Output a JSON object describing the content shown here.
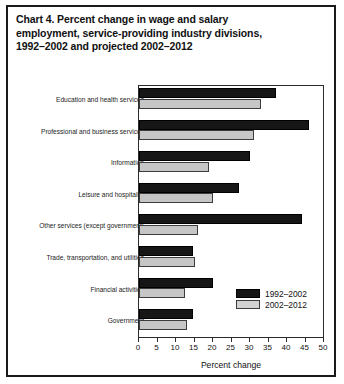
{
  "title": {
    "line1_prefix": "Chart 4.",
    "line1": "Chart 4.  Percent change in wage and salary",
    "line2": "employment, service-providing industry divisions,",
    "line3": "1992–2002 and projected 2002–2012"
  },
  "legend": {
    "position": "inside-bottom-right",
    "items": [
      {
        "label": "1992–2002",
        "color": "#161616"
      },
      {
        "label": "2002–2012",
        "color": "#d2d2d2"
      }
    ]
  },
  "chart_data": {
    "type": "bar",
    "orientation": "horizontal",
    "title": "Chart 4. Percent change in wage and salary employment, service-providing industry divisions, 1992–2002 and projected 2002–2012",
    "xlabel": "Percent change",
    "ylabel": "",
    "xlim": [
      0,
      50
    ],
    "xticks": [
      0,
      5,
      10,
      15,
      20,
      25,
      30,
      35,
      40,
      45,
      50
    ],
    "grid": false,
    "categories": [
      "Education and health services",
      "Professional and business services",
      "Information",
      "Leisure and hospitality",
      "Other services (except government)",
      "Trade, transportation, and utilities",
      "Financial activities",
      "Government"
    ],
    "series": [
      {
        "name": "1992–2002",
        "color": "#161616",
        "values": [
          37,
          46,
          30,
          27,
          44,
          14.5,
          20,
          14.5
        ]
      },
      {
        "name": "2002–2012",
        "color": "#d2d2d2",
        "values": [
          33,
          31,
          19,
          20,
          16,
          15,
          12.5,
          13
        ]
      }
    ]
  }
}
